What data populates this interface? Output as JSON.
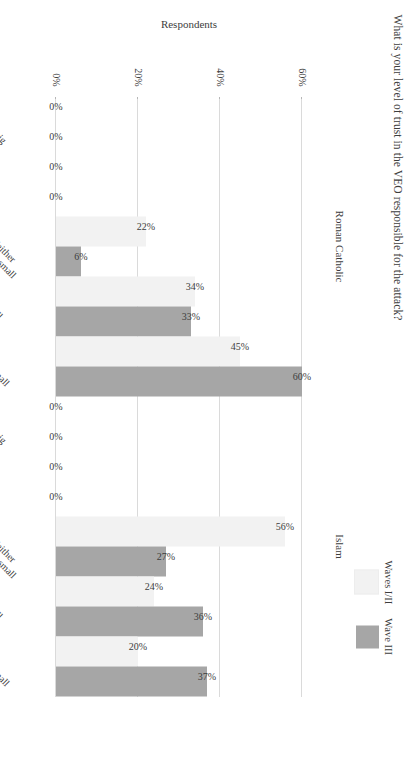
{
  "figure": {
    "title": "What is your level of trust in the VEO responsible for the attack?",
    "group_axis_title": "Religion",
    "value_axis_title": "Respondents"
  },
  "legend": {
    "items": [
      {
        "label": "Waves I/II",
        "color": "#f2f2f2"
      },
      {
        "label": "Wave III",
        "color": "#a6a6a6"
      }
    ]
  },
  "axis": {
    "ticks": [
      "0%",
      "20%",
      "40%",
      "60%"
    ],
    "tick_values": [
      0,
      20,
      40,
      60
    ],
    "max": 65
  },
  "chart_data": {
    "type": "bar",
    "title": "What is your level of trust in the VEO responsible for the attack?",
    "xlabel": "Religion",
    "ylabel": "Respondents",
    "ylim": [
      0,
      65
    ],
    "grid": true,
    "legend_position": "top-right",
    "orientation": "horizontal-grouped-rotated",
    "groups": [
      "Roman Catholic",
      "Islam"
    ],
    "categories": [
      "Very big",
      "Big",
      "Neither big nor small",
      "Small",
      "Very small"
    ],
    "series": [
      {
        "name": "Waves I/II",
        "color": "#f2f2f2",
        "values_by_group": {
          "Roman Catholic": [
            0,
            0,
            22,
            34,
            45
          ],
          "Islam": [
            0,
            0,
            56,
            24,
            20
          ]
        },
        "labels_by_group": {
          "Roman Catholic": [
            "0%",
            "0%",
            "22%",
            "34%",
            "45%"
          ],
          "Islam": [
            "0%",
            "0%",
            "56%",
            "24%",
            "20%"
          ]
        }
      },
      {
        "name": "Wave III",
        "color": "#a6a6a6",
        "values_by_group": {
          "Roman Catholic": [
            0,
            0,
            6,
            33,
            60
          ],
          "Islam": [
            0,
            0,
            27,
            36,
            37
          ]
        },
        "labels_by_group": {
          "Roman Catholic": [
            "0%",
            "0%",
            "6%",
            "33%",
            "60%"
          ],
          "Islam": [
            "0%",
            "0%",
            "27%",
            "36%",
            "37%"
          ]
        }
      }
    ]
  }
}
